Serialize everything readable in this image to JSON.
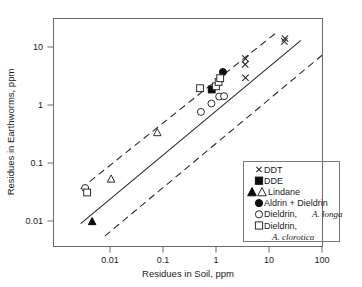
{
  "chart_data": {
    "type": "scatter",
    "title": "",
    "xlabel": "Residues in Soil, ppm",
    "ylabel": "Residues in Earthworms, ppm",
    "xscale": "log",
    "yscale": "log",
    "xlim": [
      0.0025,
      100
    ],
    "ylim": [
      0.0042,
      30
    ],
    "xticks": [
      0.01,
      0.1,
      1,
      10,
      100
    ],
    "xticklabels": [
      "0.01",
      "0.1",
      "1",
      "10",
      "100"
    ],
    "yticks": [
      0.01,
      0.1,
      1,
      10
    ],
    "yticklabels": [
      "0.01",
      "0.1",
      "1",
      "10"
    ],
    "grid": false,
    "legend_position": "lower-right",
    "annotations": [
      {
        "name": "regression-line",
        "style": "solid",
        "description": "1:1 trend line, slope 1 on log-log"
      },
      {
        "name": "upper-confidence-band",
        "style": "dashed"
      },
      {
        "name": "lower-confidence-band",
        "style": "dashed"
      }
    ],
    "lines": [
      {
        "name": "regression-line",
        "style": "solid",
        "points": [
          [
            0.0028,
            0.009
          ],
          [
            40.0,
            13.0
          ]
        ]
      },
      {
        "name": "upper-confidence-band",
        "style": "dashed",
        "points": [
          [
            0.0028,
            0.036
          ],
          [
            13.0,
            17.0
          ]
        ]
      },
      {
        "name": "lower-confidence-band",
        "style": "dashed",
        "points": [
          [
            0.008,
            0.0055
          ],
          [
            100.0,
            7.2
          ]
        ]
      }
    ],
    "series": [
      {
        "name": "DDT",
        "marker": "x",
        "filled": false,
        "points": [
          [
            3.6,
            2.95
          ],
          [
            3.55,
            5.0
          ],
          [
            3.6,
            6.3
          ],
          [
            19.5,
            12.5
          ],
          [
            20.0,
            14.0
          ]
        ]
      },
      {
        "name": "DDE",
        "marker": "square",
        "filled": true,
        "points": [
          [
            0.83,
            1.85
          ]
        ]
      },
      {
        "name": "Lindane",
        "marker": "triangle",
        "filled": true,
        "points": [
          [
            0.0046,
            0.0098
          ]
        ]
      },
      {
        "name": "Lindane",
        "marker": "triangle",
        "filled": false,
        "points": [
          [
            0.0105,
            0.053
          ],
          [
            0.078,
            0.335
          ]
        ]
      },
      {
        "name": "Aldrin + Dieldrin",
        "marker": "circle",
        "filled": true,
        "points": [
          [
            1.35,
            3.7
          ]
        ]
      },
      {
        "name": "Dieldrin, A. longa",
        "marker": "circle",
        "filled": false,
        "points": [
          [
            0.0034,
            0.037
          ],
          [
            0.52,
            0.76
          ],
          [
            0.82,
            1.06
          ],
          [
            1.15,
            1.4
          ],
          [
            1.42,
            1.42
          ]
        ]
      },
      {
        "name": "Dieldrin, A. clorotica",
        "marker": "square",
        "filled": false,
        "points": [
          [
            0.0037,
            0.031
          ],
          [
            0.5,
            1.95
          ],
          [
            1.0,
            2.1
          ],
          [
            1.12,
            2.5
          ],
          [
            1.2,
            2.9
          ]
        ]
      }
    ]
  },
  "legend": {
    "entries": [
      {
        "label": "DDT",
        "markers": [
          "x"
        ]
      },
      {
        "label": "DDE",
        "markers": [
          "filled-square"
        ]
      },
      {
        "label": "Lindane",
        "markers": [
          "filled-triangle",
          "open-triangle"
        ]
      },
      {
        "label": "Aldrin + Dieldrin",
        "markers": [
          "filled-circle"
        ]
      },
      {
        "label": "Dieldrin,",
        "label_italic": "A. longa",
        "markers": [
          "open-circle"
        ]
      },
      {
        "label": "Dieldrin,",
        "markers": [
          "open-square"
        ]
      },
      {
        "label_italic": "A. clorotica",
        "markers": []
      }
    ]
  },
  "colors": {
    "marker_fill": "#0d0d0d",
    "marker_stroke": "#2b2b2b",
    "line": "#2b2b2b",
    "axis": "#6b6b6b",
    "background": "#ffffff"
  }
}
